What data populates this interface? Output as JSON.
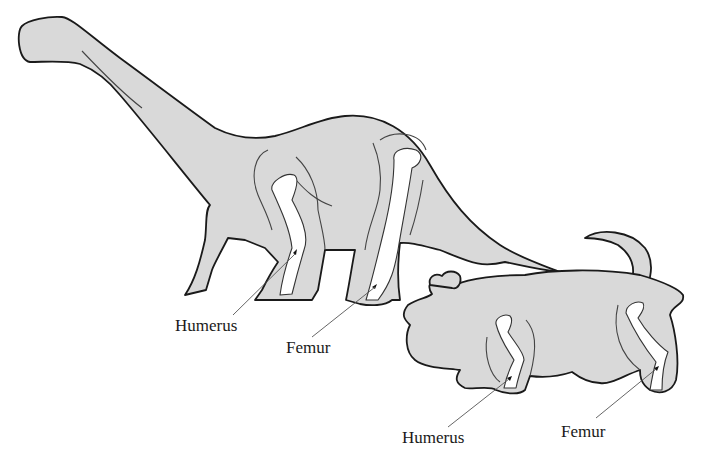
{
  "figure": {
    "animals": [
      {
        "name": "sauropod",
        "labels": {
          "front_bone": "Humerus",
          "hind_bone": "Femur"
        }
      },
      {
        "name": "hippopotamus",
        "labels": {
          "front_bone": "Humerus",
          "hind_bone": "Femur"
        }
      }
    ],
    "colors": {
      "body_fill": "#d9d9d9",
      "outline": "#1a1a1a",
      "bone_fill": "#ffffff",
      "background": "#ffffff"
    }
  }
}
